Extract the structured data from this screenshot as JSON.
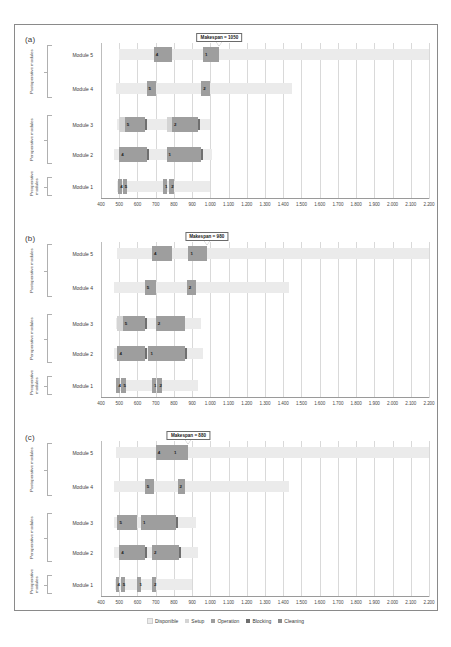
{
  "figure": {
    "panels": [
      {
        "id": "a",
        "label": "(a)",
        "makespan_text": "Makespan = 1050",
        "makespan_value": 1050
      },
      {
        "id": "b",
        "label": "(b)",
        "makespan_text": "Makespan = 980",
        "makespan_value": 980
      },
      {
        "id": "c",
        "label": "(c)",
        "makespan_text": "Makespan = 880",
        "makespan_value": 880
      }
    ],
    "groups": [
      {
        "name": "postoperative",
        "label": "Postoperative modules",
        "rows": [
          "Module 5",
          "Module 4"
        ]
      },
      {
        "name": "peroperative",
        "label": "Peroperative modules",
        "rows": [
          "Module 3",
          "Module 2"
        ]
      },
      {
        "name": "preoperative",
        "label": "Preoperative modules",
        "rows": [
          "Module 1"
        ]
      }
    ],
    "row_labels": [
      "Module 5",
      "Module 4",
      "Module 3",
      "Module 2",
      "Module 1"
    ],
    "legend": [
      {
        "key": "disponible",
        "label": "Disponible",
        "color": "#ebebeb"
      },
      {
        "key": "setup",
        "label": "Setup",
        "color": "#d4d4d4"
      },
      {
        "key": "operation",
        "label": "Operation",
        "color": "#9e9e9e"
      },
      {
        "key": "blocking",
        "label": "Blocking",
        "color": "#6f6f6f"
      },
      {
        "key": "cleaning",
        "label": "Cleaning",
        "color": "#8a8a8a"
      }
    ]
  },
  "chart_data": {
    "type": "bar",
    "chart_kind": "gantt",
    "title": "",
    "xlabel": "",
    "ylabel": "",
    "xlim": [
      400,
      2200
    ],
    "xticks": [
      400,
      500,
      600,
      700,
      800,
      900,
      "1.000",
      "1.100",
      "1.200",
      "1.300",
      "1.400",
      "1.500",
      "1.600",
      "1.700",
      "1.800",
      "1.900",
      "2.000",
      "2.100",
      "2.200"
    ],
    "xtick_values": [
      400,
      500,
      600,
      700,
      800,
      900,
      1000,
      1100,
      1200,
      1300,
      1400,
      1500,
      1600,
      1700,
      1800,
      1900,
      2000,
      2100,
      2200
    ],
    "grid": true,
    "legend_position": "bottom",
    "series_names": [
      "Disponible",
      "Setup",
      "Operation",
      "Blocking",
      "Cleaning"
    ],
    "panels": [
      {
        "id": "a",
        "makespan": 1050,
        "rows": [
          {
            "module": "Module 5",
            "available": [
              500,
              2200
            ],
            "tasks": [
              {
                "type": "operation",
                "start": 690,
                "end": 790,
                "label": "4"
              },
              {
                "type": "operation",
                "start": 960,
                "end": 1050,
                "label": "1"
              }
            ]
          },
          {
            "module": "Module 4",
            "available": [
              480,
              1450
            ],
            "tasks": [
              {
                "type": "operation",
                "start": 650,
                "end": 700,
                "label": "5"
              },
              {
                "type": "operation",
                "start": 950,
                "end": 1000,
                "label": "2"
              }
            ]
          },
          {
            "module": "Module 3",
            "available": [
              490,
              1000
            ],
            "tasks": [
              {
                "type": "setup",
                "start": 500,
                "end": 530,
                "label": ""
              },
              {
                "type": "operation",
                "start": 530,
                "end": 640,
                "label": "5"
              },
              {
                "type": "blocking",
                "start": 640,
                "end": 655,
                "label": ""
              },
              {
                "type": "setup",
                "start": 760,
                "end": 790,
                "label": ""
              },
              {
                "type": "operation",
                "start": 790,
                "end": 930,
                "label": "2"
              },
              {
                "type": "blocking",
                "start": 930,
                "end": 945,
                "label": ""
              }
            ]
          },
          {
            "module": "Module 2",
            "available": [
              470,
              1010
            ],
            "tasks": [
              {
                "type": "operation",
                "start": 500,
                "end": 650,
                "label": "4"
              },
              {
                "type": "blocking",
                "start": 650,
                "end": 665,
                "label": ""
              },
              {
                "type": "operation",
                "start": 760,
                "end": 950,
                "label": "1"
              },
              {
                "type": "blocking",
                "start": 950,
                "end": 960,
                "label": ""
              }
            ]
          },
          {
            "module": "Module 1",
            "available": [
              490,
              1000
            ],
            "tasks": [
              {
                "type": "operation",
                "start": 495,
                "end": 515,
                "label": "4"
              },
              {
                "type": "operation",
                "start": 520,
                "end": 545,
                "label": "5"
              },
              {
                "type": "operation",
                "start": 740,
                "end": 760,
                "label": "1"
              },
              {
                "type": "operation",
                "start": 775,
                "end": 800,
                "label": "2"
              }
            ]
          }
        ]
      },
      {
        "id": "b",
        "makespan": 980,
        "rows": [
          {
            "module": "Module 5",
            "available": [
              490,
              2200
            ],
            "tasks": [
              {
                "type": "operation",
                "start": 680,
                "end": 790,
                "label": "4"
              },
              {
                "type": "operation",
                "start": 880,
                "end": 980,
                "label": "1"
              }
            ]
          },
          {
            "module": "Module 4",
            "available": [
              470,
              1430
            ],
            "tasks": [
              {
                "type": "operation",
                "start": 640,
                "end": 700,
                "label": "5"
              },
              {
                "type": "operation",
                "start": 870,
                "end": 920,
                "label": "2"
              }
            ]
          },
          {
            "module": "Module 3",
            "available": [
              480,
              950
            ],
            "tasks": [
              {
                "type": "setup",
                "start": 490,
                "end": 520,
                "label": ""
              },
              {
                "type": "operation",
                "start": 520,
                "end": 640,
                "label": "5"
              },
              {
                "type": "blocking",
                "start": 640,
                "end": 655,
                "label": ""
              },
              {
                "type": "operation",
                "start": 700,
                "end": 860,
                "label": "2"
              }
            ]
          },
          {
            "module": "Module 2",
            "available": [
              470,
              960
            ],
            "tasks": [
              {
                "type": "operation",
                "start": 490,
                "end": 640,
                "label": "4"
              },
              {
                "type": "blocking",
                "start": 640,
                "end": 652,
                "label": ""
              },
              {
                "type": "operation",
                "start": 660,
                "end": 860,
                "label": "1"
              },
              {
                "type": "blocking",
                "start": 860,
                "end": 870,
                "label": ""
              }
            ]
          },
          {
            "module": "Module 1",
            "available": [
              480,
              930
            ],
            "tasks": [
              {
                "type": "operation",
                "start": 485,
                "end": 505,
                "label": "4"
              },
              {
                "type": "operation",
                "start": 512,
                "end": 535,
                "label": "5"
              },
              {
                "type": "operation",
                "start": 680,
                "end": 700,
                "label": "1"
              },
              {
                "type": "operation",
                "start": 710,
                "end": 735,
                "label": "2"
              }
            ]
          }
        ]
      },
      {
        "id": "c",
        "makespan": 880,
        "rows": [
          {
            "module": "Module 5",
            "available": [
              480,
              2200
            ],
            "tasks": [
              {
                "type": "operation",
                "start": 700,
                "end": 790,
                "label": "4"
              },
              {
                "type": "operation",
                "start": 790,
                "end": 880,
                "label": "1"
              }
            ]
          },
          {
            "module": "Module 4",
            "available": [
              470,
              1430
            ],
            "tasks": [
              {
                "type": "operation",
                "start": 640,
                "end": 690,
                "label": "5"
              },
              {
                "type": "operation",
                "start": 820,
                "end": 860,
                "label": "2"
              }
            ]
          },
          {
            "module": "Module 3",
            "available": [
              470,
              920
            ],
            "tasks": [
              {
                "type": "operation",
                "start": 490,
                "end": 600,
                "label": "5"
              },
              {
                "type": "operation",
                "start": 620,
                "end": 810,
                "label": "1"
              },
              {
                "type": "blocking",
                "start": 810,
                "end": 822,
                "label": ""
              }
            ]
          },
          {
            "module": "Module 2",
            "available": [
              470,
              930
            ],
            "tasks": [
              {
                "type": "operation",
                "start": 500,
                "end": 640,
                "label": "4"
              },
              {
                "type": "blocking",
                "start": 640,
                "end": 650,
                "label": ""
              },
              {
                "type": "operation",
                "start": 680,
                "end": 830,
                "label": "2"
              },
              {
                "type": "blocking",
                "start": 830,
                "end": 840,
                "label": ""
              }
            ]
          },
          {
            "module": "Module 1",
            "available": [
              475,
              900
            ],
            "tasks": [
              {
                "type": "operation",
                "start": 480,
                "end": 500,
                "label": "4"
              },
              {
                "type": "operation",
                "start": 508,
                "end": 530,
                "label": "5"
              },
              {
                "type": "operation",
                "start": 600,
                "end": 618,
                "label": "1"
              },
              {
                "type": "operation",
                "start": 680,
                "end": 700,
                "label": "2"
              }
            ]
          }
        ]
      }
    ]
  }
}
